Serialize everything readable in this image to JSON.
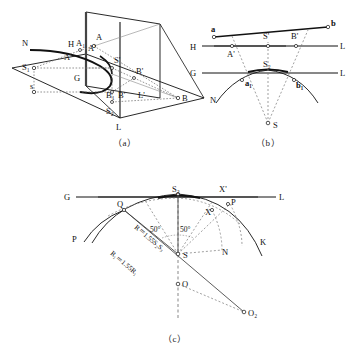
{
  "page": {
    "background": "#ffffff",
    "ink": "#111111",
    "thin_ink": "#555555"
  },
  "captions": {
    "a": "（a）",
    "b": "（b）",
    "c": "（c）"
  },
  "figure_a": {
    "name": "perspective-dihedral-construction",
    "labels": {
      "N": "N",
      "H": "H",
      "A1": "A₁",
      "Aprime": "A'",
      "A_top": "A",
      "A_left": "A",
      "Sprime": "S'",
      "S1": "S₁",
      "s": "s",
      "G": "G",
      "B1": "B₁",
      "Bprime": "B'",
      "Bprime_right": "B'",
      "B_right": "B",
      "Lprime": "L'",
      "S2": "S₂",
      "L_bottom": "L"
    }
  },
  "figure_b": {
    "name": "plan-elevation-rabatment",
    "labels": {
      "a": "a",
      "b": "b",
      "H": "H",
      "L_top": "L",
      "Aprime": "A'",
      "Sprime": "S'",
      "Bprime": "B'",
      "G": "G",
      "L_mid": "L",
      "S2": "S₂",
      "a1": "a₁",
      "b1": "b₁",
      "N": "N",
      "S": "S"
    }
  },
  "figure_c": {
    "name": "arc-radius-construction",
    "labels": {
      "G": "G",
      "S2": "S₂",
      "Xprime": "X'",
      "L": "L",
      "Q": "Q",
      "P_right": "P",
      "X": "X",
      "P_left": "P",
      "K": "K",
      "N": "N",
      "S": "S",
      "O": "O",
      "O2": "O₂"
    },
    "annotations": {
      "angle_left": "50°",
      "angle_right": "50°",
      "radius_1": "R＝1.55S₂S₃",
      "radius_2": "R₁＝1.55R₁"
    }
  }
}
